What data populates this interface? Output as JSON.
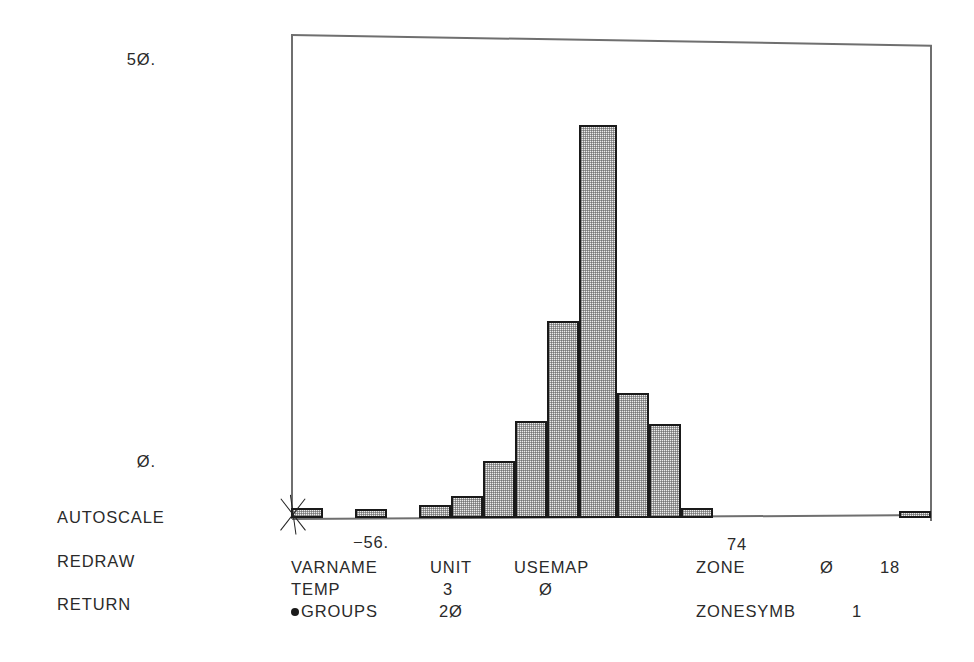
{
  "menu": {
    "items": [
      {
        "label": "AUTOSCALE",
        "top": 508
      },
      {
        "label": "REDRAW",
        "top": 552
      },
      {
        "label": "RETURN",
        "top": 595
      }
    ]
  },
  "axis": {
    "y_labels": [
      {
        "text": "5Ø.",
        "top": 50
      },
      {
        "text": "Ø.",
        "top": 452
      }
    ],
    "x_labels": [
      {
        "text": "−56.",
        "left": 371,
        "top": 533
      },
      {
        "text": "74",
        "left": 737,
        "top": 535
      }
    ]
  },
  "params": {
    "header": [
      {
        "text": "VARNAME",
        "left": 0,
        "top": 0
      },
      {
        "text": "UNIT",
        "left": 139,
        "top": 0
      },
      {
        "text": "USEMAP",
        "left": 223,
        "top": 0
      },
      {
        "text": "ZONE",
        "left": 405,
        "top": 0
      },
      {
        "text": "Ø",
        "left": 529,
        "top": 0
      },
      {
        "text": "18",
        "left": 589,
        "top": 0
      }
    ],
    "row_varname": [
      {
        "text": "TEMP",
        "left": 0,
        "top": 22
      },
      {
        "text": "3",
        "left": 152,
        "top": 22
      },
      {
        "text": "Ø",
        "left": 248,
        "top": 22
      }
    ],
    "row_groups_label": "GROUPS",
    "row_groups": [
      {
        "text": "2Ø",
        "left": 148,
        "top": 44
      },
      {
        "text": "ZONESYMB",
        "left": 405,
        "top": 44
      },
      {
        "text": "1",
        "left": 561,
        "top": 44
      }
    ]
  },
  "chart_data": {
    "type": "bar",
    "title": "",
    "xlabel": "",
    "ylabel": "",
    "grid": false,
    "legend": null,
    "ylim": [
      0,
      50
    ],
    "ytick_values": [
      0,
      50
    ],
    "ytick_labels": [
      "Ø.",
      "5Ø."
    ],
    "xlim": [
      -56,
      74
    ],
    "xtick_values": [
      -56,
      74
    ],
    "xtick_labels": [
      "−56.",
      "74"
    ],
    "bin_count": 20,
    "bin_width_px": 32,
    "plot_px": {
      "left": 291,
      "top": 34,
      "right": 931,
      "baseline": 518,
      "y_value_50_px": 60,
      "y_value_0_px": 518
    },
    "categories": [
      "-56",
      "-49.5",
      "-43",
      "-36.5",
      "-30",
      "-23.5",
      "-17",
      "-10.5",
      "-4",
      "2.5",
      "9",
      "15.5",
      "22",
      "28.5",
      "35",
      "41.5",
      "48",
      "54.5",
      "61",
      "67.5"
    ],
    "values": [
      1,
      0,
      1,
      1.5,
      2.5,
      6,
      11,
      21,
      43,
      13.5,
      10,
      1,
      0,
      0,
      0,
      0,
      0,
      0,
      0,
      1
    ],
    "bars_px": [
      {
        "index": 0,
        "left": 0,
        "width": 32,
        "top": 474,
        "height": 10
      },
      {
        "index": 1,
        "left": 32,
        "width": 32,
        "top": 484,
        "height": 0
      },
      {
        "index": 2,
        "left": 64,
        "width": 32,
        "top": 475,
        "height": 9
      },
      {
        "index": 3,
        "left": 96,
        "width": 32,
        "top": 484,
        "height": 0
      },
      {
        "index": 4,
        "left": 128,
        "width": 32,
        "top": 471,
        "height": 13
      },
      {
        "index": 5,
        "left": 160,
        "width": 32,
        "top": 462,
        "height": 22
      },
      {
        "index": 6,
        "left": 192,
        "width": 32,
        "top": 427,
        "height": 57
      },
      {
        "index": 7,
        "left": 224,
        "width": 32,
        "top": 387,
        "height": 97
      },
      {
        "index": 8,
        "left": 256,
        "width": 32,
        "top": 287,
        "height": 197
      },
      {
        "index": 9,
        "left": 288,
        "width": 38,
        "top": 91,
        "height": 393
      },
      {
        "index": 10,
        "left": 326,
        "width": 32,
        "top": 359,
        "height": 125
      },
      {
        "index": 11,
        "left": 358,
        "width": 32,
        "top": 390,
        "height": 94
      },
      {
        "index": 12,
        "left": 390,
        "width": 32,
        "top": 474,
        "height": 10
      },
      {
        "index": 13,
        "left": 608,
        "width": 32,
        "top": 483,
        "height": 7
      }
    ]
  },
  "cursor": {
    "name": "crosshair-marker",
    "x": 293,
    "y": 515
  }
}
